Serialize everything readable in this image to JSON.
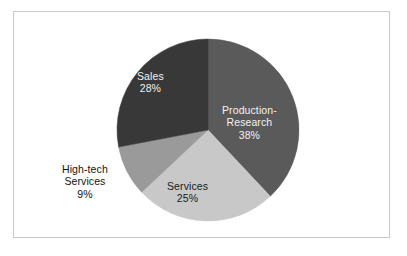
{
  "figure": {
    "background_color": "#ffffff",
    "frame_color": "#c9c9c9"
  },
  "chart_data": {
    "type": "pie",
    "title": "",
    "subtitle": "",
    "xlabel": "",
    "ylabel": "",
    "legend_position": "none",
    "grid": false,
    "start_angle_deg": 0,
    "direction": "clockwise",
    "units": "percent",
    "total": 100,
    "categories": [
      "Production-Research",
      "Services",
      "High-tech Services",
      "Sales"
    ],
    "values": [
      38,
      25,
      9,
      28
    ],
    "labels_text": [
      "38%",
      "25%",
      "9%",
      "28%"
    ],
    "colors": [
      "#5a5a5a",
      "#c8c8c8",
      "#9a9a9a",
      "#383838"
    ],
    "slices": [
      {
        "name": "Production-Research",
        "label_line1": "Production-",
        "label_line2": "Research",
        "value": 38,
        "value_text": "38%",
        "color": "#5a5a5a",
        "label_placement": "inside",
        "label_color": "#f2f2f2"
      },
      {
        "name": "Services",
        "label_line1": "Services",
        "label_line2": "",
        "value": 25,
        "value_text": "25%",
        "color": "#c8c8c8",
        "label_placement": "inside",
        "label_color": "#1a1a1a"
      },
      {
        "name": "High-tech Services",
        "label_line1": "High-tech",
        "label_line2": "Services",
        "value": 9,
        "value_text": "9%",
        "color": "#9a9a9a",
        "label_placement": "outside",
        "label_color": "#111111"
      },
      {
        "name": "Sales",
        "label_line1": "Sales",
        "label_line2": "",
        "value": 28,
        "value_text": "28%",
        "color": "#383838",
        "label_placement": "inside",
        "label_color": "#f2f2f2"
      }
    ],
    "geometry": {
      "center_x": 208,
      "center_y": 130,
      "radius": 91
    }
  }
}
